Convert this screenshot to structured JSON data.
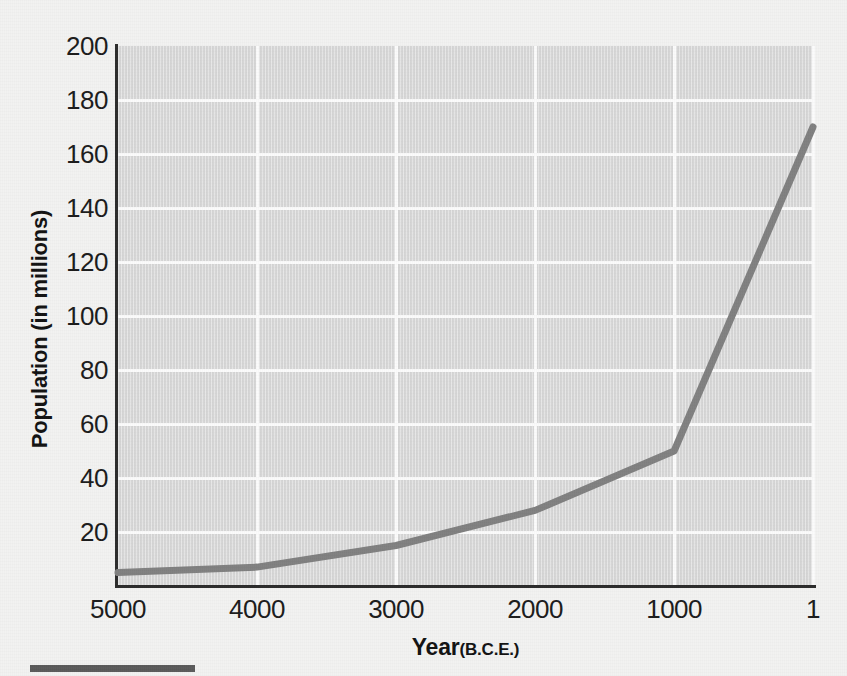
{
  "figure": {
    "page_background": "#f2f2f1",
    "plot_background": "#dddddd",
    "gridline_color": "#fbfbfb",
    "axis_color": "#2b2b2b",
    "series_color": "#808080"
  },
  "axes": {
    "y_title": "Population (in millions)",
    "x_title_main": "Year",
    "x_title_sub": "(B.C.E.)"
  },
  "chart_data": {
    "type": "line",
    "title": "",
    "subtitle": "",
    "xlabel": "Year (B.C.E.)",
    "ylabel": "Population (in millions)",
    "x": [
      5000,
      4000,
      3000,
      2000,
      1000,
      1
    ],
    "values": [
      5,
      7,
      15,
      28,
      50,
      170
    ],
    "x_tick_labels": [
      "5000",
      "4000",
      "3000",
      "2000",
      "1000",
      "1"
    ],
    "y_tick_labels": [
      "20",
      "40",
      "60",
      "80",
      "100",
      "120",
      "140",
      "160",
      "180",
      "200"
    ],
    "y_ticks": [
      20,
      40,
      60,
      80,
      100,
      120,
      140,
      160,
      180,
      200
    ],
    "xlim": [
      5000,
      1
    ],
    "ylim": [
      0,
      200
    ],
    "x_axis_inverted": true,
    "grid": true,
    "grid_axes": "both",
    "legend": false,
    "legend_position": "none",
    "series": [
      {
        "name": "World population",
        "values": [
          5,
          7,
          15,
          28,
          50,
          170
        ]
      }
    ],
    "annotations": []
  }
}
